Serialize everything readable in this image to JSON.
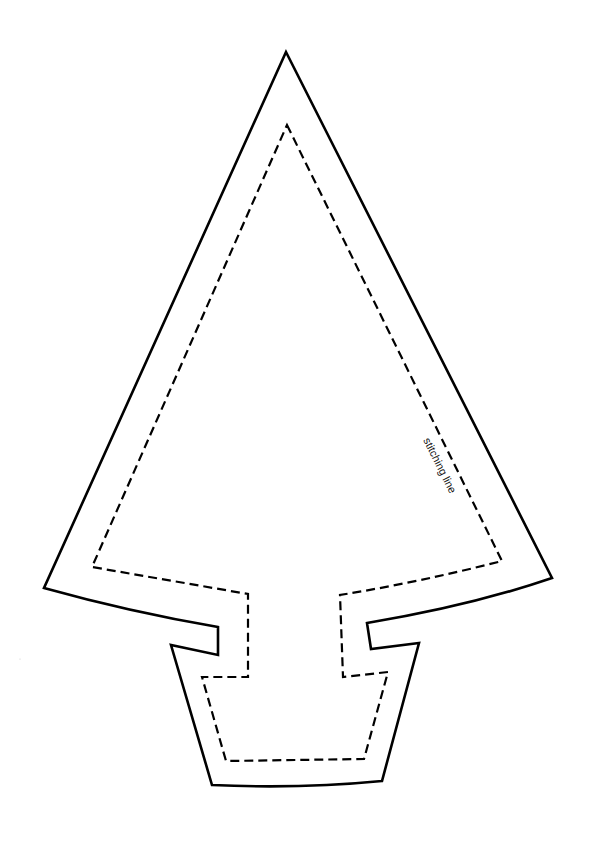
{
  "diagram": {
    "shapes": [
      {
        "name": "cutting-outline",
        "style": "solid",
        "color": "#000000"
      },
      {
        "name": "stitching-outline",
        "style": "dashed",
        "color": "#000000"
      }
    ],
    "labels": {
      "stitching": "stitching line"
    }
  }
}
